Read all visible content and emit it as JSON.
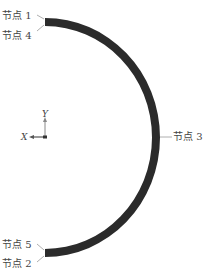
{
  "diagram": {
    "type": "semicircular-arc-model",
    "arc_color": "#2b2b2b",
    "leader_color": "#999999",
    "nodes": [
      {
        "id": "node1",
        "label": "节点 1",
        "position": "top-outer"
      },
      {
        "id": "node4",
        "label": "节点 4",
        "position": "top-inner"
      },
      {
        "id": "node3",
        "label": "节点 3",
        "position": "middle-right"
      },
      {
        "id": "node5",
        "label": "节点 5",
        "position": "bottom-inner"
      },
      {
        "id": "node2",
        "label": "节点 2",
        "position": "bottom-outer"
      }
    ],
    "axes": {
      "x_label": "X",
      "y_label": "Y"
    }
  }
}
